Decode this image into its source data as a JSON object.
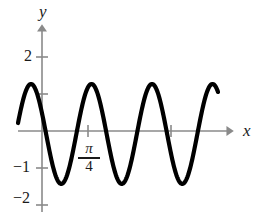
{
  "figure": {
    "background_color": "#ffffff",
    "axis_color": "#8a8a8a",
    "curve_color": "#000000",
    "text_color": "#1a1a1a",
    "axis_label_x": "x",
    "axis_label_y": "y"
  },
  "y_axis": {
    "ticks": [
      {
        "value": 2,
        "label": "2"
      },
      {
        "value": 1,
        "label": ""
      },
      {
        "value": -1,
        "label": "−1"
      },
      {
        "value": -2,
        "label": "−2"
      }
    ]
  },
  "x_axis": {
    "ticks": [
      {
        "pixel": 88,
        "label_numerator": "π",
        "label_denominator": "4"
      },
      {
        "pixel": 171,
        "label_numerator": "",
        "label_denominator": ""
      }
    ]
  },
  "chart_data": {
    "type": "line",
    "title": "",
    "xlabel": "x",
    "ylabel": "y",
    "grid": false,
    "legend": null,
    "xlim": [
      -0.1,
      3.3
    ],
    "ylim": [
      -2.4,
      2.4
    ],
    "y_ticks": [
      2,
      1,
      -1,
      -2
    ],
    "y_tick_labels": [
      "2",
      "",
      "−1",
      "−2"
    ],
    "x_ticks": [
      0.7853981634,
      1.5707963268
    ],
    "x_tick_labels": [
      "π/4",
      ""
    ],
    "series": [
      {
        "name": "wave",
        "form": "amplitude * cos(frequency * x + phase) + offset",
        "amplitude": 1.35,
        "frequency": 8.0,
        "phase": 0.0,
        "offset": -0.08,
        "period_pixels": 60.5,
        "peak_value": 1.43,
        "trough_value": -1.27,
        "peak_pixels_x": [
          31,
          92,
          152,
          213
        ],
        "trough_pixels_x": [
          62,
          122,
          183
        ],
        "x_start_pixel": 18,
        "x_end_pixel": 218
      }
    ]
  },
  "geometry": {
    "origin_x": 42,
    "origin_y": 131,
    "unit_y_pixels": 37,
    "y_axis_top": 25,
    "x_axis_right": 234,
    "tick_half_len": 6,
    "curve_stroke_width": 4.2,
    "axis_stroke_width": 1.6
  }
}
